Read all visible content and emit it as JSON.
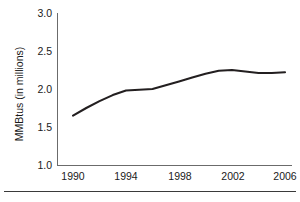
{
  "chart_data": {
    "type": "line",
    "title": "",
    "subtitle": "",
    "xlabel": "",
    "ylabel": "MMBtus (in millions)",
    "x": [
      1990,
      1991,
      1992,
      1993,
      1994,
      1995,
      1996,
      1997,
      1998,
      1999,
      2000,
      2001,
      2002,
      2003,
      2004,
      2005,
      2006
    ],
    "series": [
      {
        "name": "MMBtus",
        "values": [
          1.65,
          1.75,
          1.84,
          1.92,
          1.98,
          1.99,
          2.0,
          2.05,
          2.1,
          2.15,
          2.2,
          2.24,
          2.25,
          2.23,
          2.21,
          2.21,
          2.22
        ]
      }
    ],
    "xlim": [
      1990,
      2006
    ],
    "ylim": [
      1.0,
      3.0
    ],
    "xticks": [
      1990,
      1994,
      1998,
      2002,
      2006
    ],
    "xtick_labels": [
      "1990",
      "1994",
      "1998",
      "2002",
      "2006"
    ],
    "yticks": [
      1.0,
      1.5,
      2.0,
      2.5,
      3.0
    ],
    "ytick_labels": [
      "1.0",
      "1.5",
      "2.0",
      "2.5",
      "3.0"
    ],
    "grid": false,
    "legend": "none",
    "line_color": "#231f20",
    "axis_color": "#6b6b6b",
    "background": "#ffffff",
    "annotations": []
  },
  "figure": {
    "rule_color": "#3a3a3a"
  }
}
